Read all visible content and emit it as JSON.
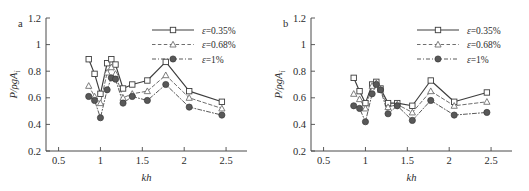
{
  "figure": {
    "panels": [
      {
        "label": "a",
        "axes": {
          "xlabel": "kh",
          "ylabel": "P/ρgA",
          "ylabel_sub": "i",
          "xlim": [
            0.35,
            2.75
          ],
          "ylim": [
            0.2,
            1.2
          ],
          "xticks": [
            0.5,
            1,
            1.5,
            2,
            2.5
          ],
          "xtick_labels": [
            "0.5",
            "1",
            "1.5",
            "2",
            "2.5"
          ],
          "yticks": [
            0.2,
            0.4,
            0.6,
            0.8,
            1,
            1.2
          ],
          "ytick_labels": [
            "0.2",
            "0.4",
            "0.6",
            "0.8",
            "1",
            "1.2"
          ],
          "grid": false
        },
        "legend": {
          "position": "top-right",
          "entries": [
            {
              "label": "ε=0.35%",
              "marker": "open-square",
              "line": "solid"
            },
            {
              "label": "ε=0.68%",
              "marker": "open-triangle",
              "line": "dashed"
            },
            {
              "label": "ε=1%",
              "marker": "filled-circle",
              "line": "dash-dot"
            }
          ]
        },
        "chart_data": {
          "type": "line",
          "title": "a",
          "xlabel": "kh",
          "ylabel": "P/ρgA_i",
          "xlim": [
            0.35,
            2.75
          ],
          "ylim": [
            0.2,
            1.2
          ],
          "grid": false,
          "legend_position": "top-right",
          "x": [
            0.86,
            0.93,
            1.0,
            1.08,
            1.13,
            1.18,
            1.27,
            1.38,
            1.56,
            1.78,
            2.06,
            2.45
          ],
          "series": [
            {
              "name": "ε=0.35%",
              "marker": "open-square",
              "line": "solid",
              "values": [
                0.89,
                0.78,
                0.63,
                0.86,
                0.89,
                0.85,
                0.67,
                0.7,
                0.73,
                0.87,
                0.65,
                0.57
              ]
            },
            {
              "name": "ε=0.68%",
              "marker": "open-triangle",
              "line": "dashed",
              "values": [
                0.69,
                0.61,
                0.56,
                0.79,
                0.83,
                0.78,
                0.6,
                0.63,
                0.65,
                0.77,
                0.6,
                0.52
              ]
            },
            {
              "name": "ε=1%",
              "marker": "filled-circle",
              "line": "dash-dot",
              "values": [
                0.61,
                0.58,
                0.45,
                0.66,
                0.75,
                0.74,
                0.56,
                0.61,
                0.58,
                0.7,
                0.53,
                0.47
              ]
            }
          ]
        }
      },
      {
        "label": "b",
        "axes": {
          "xlabel": "kh",
          "ylabel": "P/ρgA",
          "ylabel_sub": "i",
          "xlim": [
            0.35,
            2.75
          ],
          "ylim": [
            0.2,
            1.2
          ],
          "xticks": [
            0.5,
            1,
            1.5,
            2,
            2.5
          ],
          "xtick_labels": [
            "0.5",
            "1",
            "1.5",
            "2",
            "2.5"
          ],
          "yticks": [
            0.2,
            0.4,
            0.6,
            0.8,
            1,
            1.2
          ],
          "ytick_labels": [
            "0.2",
            "0.4",
            "0.6",
            "0.8",
            "1",
            "1.2"
          ],
          "grid": false
        },
        "legend": {
          "position": "top-right",
          "entries": [
            {
              "label": "ε=0.35%",
              "marker": "open-square",
              "line": "solid"
            },
            {
              "label": "ε=0.68%",
              "marker": "open-triangle",
              "line": "dashed"
            },
            {
              "label": "ε=1%",
              "marker": "filled-circle",
              "line": "dash-dot"
            }
          ]
        },
        "chart_data": {
          "type": "line",
          "title": "b",
          "xlabel": "kh",
          "ylabel": "P/ρgA_i",
          "xlim": [
            0.35,
            2.75
          ],
          "ylim": [
            0.2,
            1.2
          ],
          "grid": false,
          "legend_position": "top-right",
          "x": [
            0.86,
            0.93,
            1.0,
            1.08,
            1.13,
            1.18,
            1.27,
            1.38,
            1.56,
            1.78,
            2.06,
            2.45
          ],
          "series": [
            {
              "name": "ε=0.35%",
              "marker": "open-square",
              "line": "solid",
              "values": [
                0.75,
                0.65,
                0.56,
                0.7,
                0.72,
                0.67,
                0.56,
                0.56,
                0.54,
                0.73,
                0.57,
                0.64
              ]
            },
            {
              "name": "ε=0.68%",
              "marker": "open-triangle",
              "line": "dashed",
              "values": [
                0.63,
                0.59,
                0.52,
                0.69,
                0.71,
                0.66,
                0.53,
                0.55,
                0.49,
                0.65,
                0.54,
                0.57
              ]
            },
            {
              "name": "ε=1%",
              "marker": "filled-circle",
              "line": "dash-dot",
              "values": [
                0.54,
                0.52,
                0.42,
                0.63,
                0.7,
                0.66,
                0.48,
                0.54,
                0.43,
                0.58,
                0.47,
                0.49
              ]
            }
          ]
        }
      }
    ],
    "style": {
      "series_colors": [
        "#3d3d3d",
        "#6e6e6e",
        "#5a5a5a"
      ],
      "axis_color": "#4a4a4a",
      "text_color": "#2b2b2b",
      "background": "#ffffff"
    }
  }
}
